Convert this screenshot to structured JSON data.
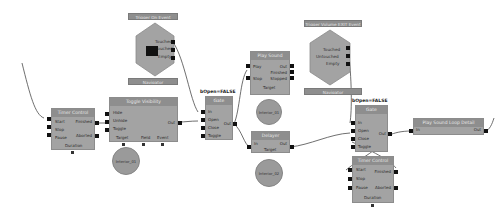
{
  "colors": {
    "node_body": "#a3a3a3",
    "node_title": "#8e8e8e",
    "port": "#111111",
    "link": "#4a4a4a",
    "background": "#ffffff"
  },
  "nodes": {
    "trigger1": {
      "title": "Trigger On Event",
      "outputs": [
        "Touched",
        "Untouched",
        "Empty"
      ],
      "footer": "Navigator"
    },
    "trigger2": {
      "title": "Trigger Volume EXIT Event",
      "outputs": [
        "Touched",
        "Untouched",
        "Empty"
      ],
      "footer": "Navigator"
    },
    "timer1": {
      "title": "Timer Control",
      "inputs": [
        "Start",
        "Stop",
        "Pause"
      ],
      "outputs": [
        "Finished",
        "Aborted"
      ],
      "footer": "Duration"
    },
    "toggle": {
      "title": "Toggle Visibility",
      "inputs": [
        "Hide",
        "Unhide",
        "Toggle"
      ],
      "outputs": [
        "Out"
      ],
      "params": [
        "Target",
        "Field",
        "Event"
      ]
    },
    "gate1": {
      "label_above": "bOpen=FALSE",
      "title": "Gate",
      "inputs": [
        "In",
        "Open",
        "Close",
        "Toggle"
      ],
      "outputs": [
        "Out"
      ]
    },
    "playsound": {
      "title": "Play Sound",
      "inputs": [
        "Play",
        "Stop"
      ],
      "outputs": [
        "Out",
        "Finished",
        "Stopped"
      ],
      "footer": "Target"
    },
    "delayer": {
      "title": "Delayer",
      "inputs": [
        "In"
      ],
      "outputs": [
        "Out"
      ],
      "footer": "Target"
    },
    "gate2": {
      "label_above": "bOpen=FALSE",
      "title": "Gate",
      "inputs": [
        "In",
        "Open",
        "Close",
        "Toggle"
      ],
      "outputs": [
        "Out"
      ]
    },
    "timer2": {
      "title": "Timer Control",
      "inputs": [
        "Start",
        "Stop",
        "Pause"
      ],
      "outputs": [
        "Finished",
        "Aborted"
      ],
      "footer": "Duration"
    },
    "playsound2": {
      "title": "Play Sound Loop Detail",
      "inputs": [
        "In"
      ],
      "outputs": [
        "Out"
      ]
    }
  },
  "params": {
    "toggle_target": "Interior_01",
    "playsound_target": "Interior_01",
    "delayer_target": "Interior_02"
  }
}
